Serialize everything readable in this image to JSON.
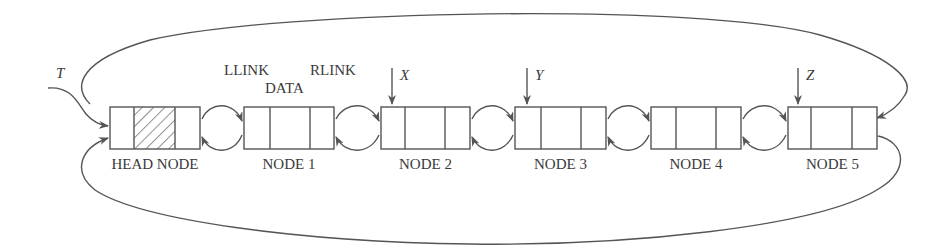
{
  "diagram": {
    "type": "circular doubly linked list with head node",
    "field_labels": {
      "llink": "LLINK",
      "data": "DATA",
      "rlink": "RLINK"
    },
    "nodes": [
      {
        "id": "head",
        "label": "HEAD NODE",
        "x": 110,
        "w": 90,
        "d1": 24,
        "d2": 65,
        "data_hatched": true
      },
      {
        "id": "n1",
        "label": "NODE 1",
        "x": 244,
        "w": 90,
        "d1": 26,
        "d2": 66,
        "data_hatched": false
      },
      {
        "id": "n2",
        "label": "NODE 2",
        "x": 381,
        "w": 89,
        "d1": 24,
        "d2": 64,
        "data_hatched": false
      },
      {
        "id": "n3",
        "label": "NODE 3",
        "x": 515,
        "w": 91,
        "d1": 26,
        "d2": 66,
        "data_hatched": false
      },
      {
        "id": "n4",
        "label": "NODE 4",
        "x": 651,
        "w": 90,
        "d1": 25,
        "d2": 65,
        "data_hatched": false
      },
      {
        "id": "n5",
        "label": "NODE 5",
        "x": 788,
        "w": 89,
        "d1": 23,
        "d2": 64,
        "data_hatched": false
      }
    ],
    "pointers": [
      {
        "name": "T",
        "target": "head"
      },
      {
        "name": "X",
        "target": "n2"
      },
      {
        "name": "Y",
        "target": "n3"
      },
      {
        "name": "Z",
        "target": "n5"
      }
    ],
    "colors": {
      "line": "#555555",
      "text": "#3a3a3a",
      "background": "#ffffff"
    }
  }
}
